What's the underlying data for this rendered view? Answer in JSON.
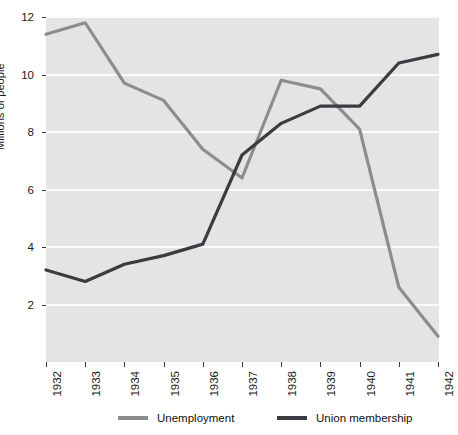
{
  "chart_data": {
    "type": "line",
    "title": "",
    "xlabel": "",
    "ylabel": "Millions of people",
    "categories": [
      "1932",
      "1933",
      "1934",
      "1935",
      "1936",
      "1937",
      "1938",
      "1939",
      "1940",
      "1941",
      "1942"
    ],
    "x": [
      1932,
      1933,
      1934,
      1935,
      1936,
      1937,
      1938,
      1939,
      1940,
      1941,
      1942
    ],
    "series": [
      {
        "name": "Unemployment",
        "color": "#8d8d8d",
        "values": [
          11.4,
          11.8,
          9.7,
          9.1,
          7.4,
          6.4,
          9.8,
          9.5,
          8.1,
          2.6,
          0.9
        ]
      },
      {
        "name": "Union membership",
        "color": "#3b3b42",
        "values": [
          3.2,
          2.8,
          3.4,
          3.7,
          4.1,
          7.2,
          8.3,
          8.9,
          8.9,
          10.4,
          10.7
        ]
      }
    ],
    "ylim": [
      0,
      12
    ],
    "yticks": [
      2,
      4,
      6,
      8,
      10,
      12
    ],
    "ytick_labels": [
      "2",
      "4",
      "6",
      "8",
      "10",
      "12"
    ],
    "xlim": [
      1932,
      1942
    ],
    "grid": "horizontal",
    "grid_color": "#fbfbfb",
    "plot_background": "#e4e4e4",
    "legend_position": "bottom"
  },
  "legend": {
    "items": [
      {
        "label": "Unemployment",
        "color": "#8d8d8d"
      },
      {
        "label": "Union membership",
        "color": "#3b3b42"
      }
    ]
  }
}
